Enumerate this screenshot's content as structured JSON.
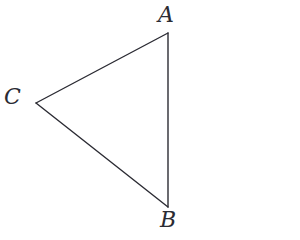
{
  "figure": {
    "type": "triangle-diagram",
    "background_color": "#ffffff",
    "stroke_color": "#2b2b33",
    "stroke_width": 1.4,
    "canvas": {
      "width": 300,
      "height": 240
    },
    "vertices": [
      {
        "id": "A",
        "label": "A",
        "x": 168,
        "y": 33,
        "label_x": 158,
        "label_y": 4
      },
      {
        "id": "B",
        "label": "B",
        "x": 168,
        "y": 207,
        "label_x": 160,
        "label_y": 209
      },
      {
        "id": "C",
        "label": "C",
        "x": 36,
        "y": 103,
        "label_x": 4,
        "label_y": 86
      }
    ],
    "edges": [
      {
        "id": "CA",
        "from": "C",
        "to": "A",
        "tick_marks": 2
      },
      {
        "id": "AB",
        "from": "A",
        "to": "B",
        "tick_marks": 0
      },
      {
        "id": "CB",
        "from": "C",
        "to": "B",
        "tick_marks": 0
      }
    ],
    "tick_marks": [
      {
        "edge": "CA",
        "x": 69,
        "y": 81,
        "style": "gap"
      },
      {
        "edge": "CA",
        "x": 153,
        "y": 38,
        "style": "gap"
      }
    ]
  }
}
